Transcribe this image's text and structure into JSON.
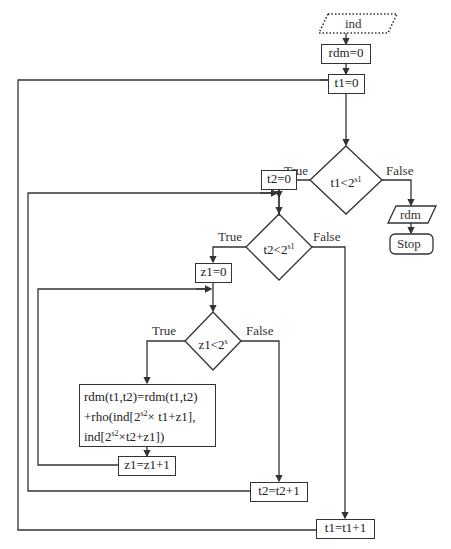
{
  "flowchart": {
    "input_node": {
      "label": "ind",
      "shape": "parallelogram-dotted"
    },
    "init_rdm": {
      "label": "rdm=0"
    },
    "init_t1": {
      "label": "t1=0"
    },
    "cond_t1": {
      "label_base": "t1<2",
      "label_sup": "s1",
      "true_label": "True",
      "false_label": "False"
    },
    "output_node": {
      "label": "rdm",
      "shape": "parallelogram"
    },
    "stop_node": {
      "label": "Stop",
      "shape": "rounded-rect"
    },
    "init_t2": {
      "label": "t2=0"
    },
    "cond_t2": {
      "label_base": "t2<2",
      "label_sup": "s1",
      "true_label": "True",
      "false_label": "False"
    },
    "init_z1": {
      "label": "z1=0"
    },
    "cond_z1": {
      "label_base": "z1<2",
      "label_sup": "s",
      "true_label": "True",
      "false_label": "False"
    },
    "update_rdm": {
      "line1": "rdm(t1,t2)=rdm(t1,t2)",
      "line2_a": "+rho(ind[2",
      "line2_sup": "s2",
      "line2_b": "× t1+z1],",
      "line3_a": "ind[2",
      "line3_sup": "s2",
      "line3_b": "×t2+z1])"
    },
    "inc_z1": {
      "label": "z1=z1+1"
    },
    "inc_t2": {
      "label": "t2=t2+1"
    },
    "inc_t1": {
      "label": "t1=t1+1"
    }
  },
  "colors": {
    "line": "#333333",
    "background": "#ffffff"
  }
}
